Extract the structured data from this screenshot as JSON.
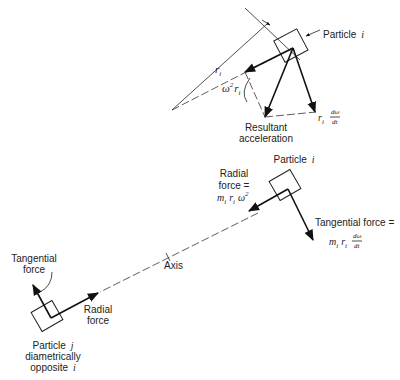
{
  "diagram": {
    "top": {
      "particle_label": "Particle",
      "particle_index": "i",
      "radius_label": "r",
      "radius_sub": "i",
      "radial_accel": {
        "omega": "ω",
        "exp": "2",
        "r": "r",
        "sub": "i"
      },
      "tangential_accel": {
        "r": "r",
        "sub": "i",
        "num": "dω",
        "den": "dt"
      },
      "resultant_line1": "Resultant",
      "resultant_line2": "acceleration"
    },
    "bottom": {
      "particle_i_label": "Particle",
      "particle_i_index": "i",
      "radial_force_line1": "Radial",
      "radial_force_line2": "force =",
      "radial_force_formula": {
        "m": "m",
        "msub": "i",
        "r": "r",
        "rsub": "i",
        "omega": "ω",
        "exp": "2"
      },
      "tangential_force_label": "Tangential force =",
      "tangential_force_formula": {
        "m": "m",
        "msub": "i",
        "r": "r",
        "rsub": "i",
        "num": "dω",
        "den": "dt"
      },
      "axis_label": "Axis",
      "particle_j_tangential_line1": "Tangential",
      "particle_j_tangential_line2": "force",
      "particle_j_radial_line1": "Radial",
      "particle_j_radial_line2": "force",
      "particle_j_line1": "Particle",
      "particle_j_index": "j",
      "particle_j_line2": "diametrically",
      "particle_j_line3": "opposite",
      "particle_j_line3_index": "i"
    }
  }
}
